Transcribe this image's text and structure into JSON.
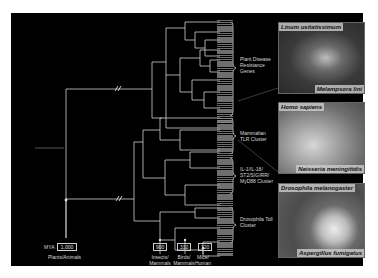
{
  "figure": {
    "background_color": "#000000",
    "line_color": "#cfcfcf",
    "axis": {
      "label": "MYA",
      "nodes": [
        {
          "value": "1,000",
          "caption": "Plants/Animals"
        },
        {
          "value": "900",
          "caption": "Insects/ Mammals"
        },
        {
          "value": "310",
          "caption": "Birds/ Mammals"
        },
        {
          "value": "120",
          "caption": "Mice/ Human"
        }
      ]
    },
    "clusters": [
      {
        "label": "Plant Disease Resistance Genes"
      },
      {
        "label": "Mammalian TLR Cluster"
      },
      {
        "label": "IL-1/IL-18/ ST2/SIGIRR/ MyD88 Cluster"
      },
      {
        "label": "Drosophila Toll Cluster"
      }
    ],
    "photos": [
      {
        "top_caption": "Linum usitatissimum",
        "bottom_caption": "Melampsora lini",
        "tone": "#4a4a4a"
      },
      {
        "top_caption": "Homo sapiens",
        "bottom_caption": "Neisseria meningitidis",
        "tone": "#9a9a9a"
      },
      {
        "top_caption": "Drosophila melanogaster",
        "bottom_caption": "Aspergillus fumigatus",
        "tone": "#6e6e6e"
      }
    ],
    "small_left_label": "— — —"
  }
}
